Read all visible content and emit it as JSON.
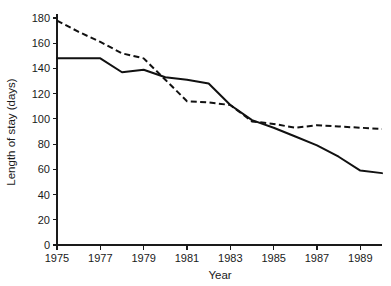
{
  "chart_data": {
    "type": "line",
    "title": "",
    "xlabel": "Year",
    "ylabel": "Length of stay (days)",
    "xlim": [
      1975,
      1990
    ],
    "ylim": [
      0,
      180
    ],
    "grid": false,
    "legend": "none",
    "x_ticks": [
      1975,
      1977,
      1979,
      1981,
      1983,
      1985,
      1987,
      1989
    ],
    "x_tick_labels": [
      "1975",
      "1977",
      "1979",
      "1981",
      "1983",
      "1985",
      "1987",
      "1989"
    ],
    "y_ticks": [
      0,
      20,
      40,
      60,
      80,
      100,
      120,
      140,
      160,
      180
    ],
    "y_tick_labels": [
      "0",
      "20",
      "40",
      "60",
      "80",
      "100",
      "120",
      "140",
      "160",
      "180"
    ],
    "x": [
      1975,
      1976,
      1977,
      1978,
      1979,
      1980,
      1981,
      1982,
      1983,
      1984,
      1985,
      1986,
      1987,
      1988,
      1989,
      1990
    ],
    "series": [
      {
        "name": "solid-series",
        "style": "solid",
        "color": "#111111",
        "values": [
          148,
          148,
          148,
          137,
          139,
          133,
          131,
          128,
          111,
          99,
          93,
          86,
          79,
          70,
          59,
          57
        ]
      },
      {
        "name": "dashed-series",
        "style": "dashed",
        "color": "#111111",
        "values": [
          178,
          169,
          161,
          152,
          148,
          131,
          114,
          113,
          111,
          98,
          96,
          93,
          95,
          94,
          93,
          92
        ]
      }
    ]
  },
  "axes": {
    "x_title": "Year",
    "y_title": "Length of stay (days)"
  }
}
